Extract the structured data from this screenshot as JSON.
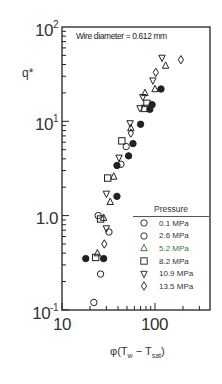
{
  "chart_data": {
    "type": "scatter",
    "title": "",
    "annotation": "Wire diameter = 0.612 mm",
    "xlabel": "φ(Tw − Tsat)",
    "ylabel": "q*",
    "xscale": "log",
    "yscale": "log",
    "xlim": [
      10,
      250
    ],
    "ylim": [
      0.1,
      100
    ],
    "x_ticks": [
      "10",
      "100"
    ],
    "y_ticks": [
      "10^-1",
      "1.0",
      "10^1",
      "10^2"
    ],
    "grid": false,
    "legend_title": "Pressure",
    "legend_position": "lower right",
    "series": [
      {
        "name": "0.1 MPa",
        "marker": "filled-circle",
        "points": [
          [
            116,
            22
          ],
          [
            93,
            15
          ],
          [
            88,
            13.4
          ],
          [
            70,
            9.3
          ],
          [
            58,
            5.8
          ],
          [
            52,
            4.3
          ],
          [
            39,
            3.4
          ],
          [
            39,
            1.6
          ],
          [
            18,
            0.35
          ],
          [
            28,
            0.35
          ]
        ]
      },
      {
        "name": "2.6 MPa",
        "marker": "circle",
        "points": [
          [
            49,
            5.4
          ],
          [
            43,
            3.5
          ],
          [
            24.5,
            1.0
          ],
          [
            32,
            0.67
          ],
          [
            26,
            0.24
          ],
          [
            22,
            0.12
          ]
        ]
      },
      {
        "name": "5.2 MPa",
        "marker": "triangle-up",
        "points": [
          [
            130,
            39
          ],
          [
            100,
            22
          ],
          [
            78,
            20
          ],
          [
            55,
            8.5
          ],
          [
            36,
            2.6
          ],
          [
            33,
            1.4
          ],
          [
            28,
            0.95
          ],
          [
            24,
            0.4
          ]
        ]
      },
      {
        "name": "8.2 MPa",
        "marker": "square",
        "points": [
          [
            82,
            15.5
          ],
          [
            78,
            13.7
          ],
          [
            44,
            6.2
          ],
          [
            31,
            2.5
          ],
          [
            26,
            0.92
          ],
          [
            23,
            0.36
          ]
        ]
      },
      {
        "name": "10.9 MPa",
        "marker": "triangle-down",
        "points": [
          [
            119,
            47
          ],
          [
            95,
            27
          ],
          [
            74,
            18
          ],
          [
            69,
            13.7
          ],
          [
            54,
            9.5
          ],
          [
            41,
            4.1
          ],
          [
            30,
            1.7
          ],
          [
            30,
            0.73
          ]
        ]
      },
      {
        "name": "13.5 MPa",
        "marker": "diamond",
        "points": [
          [
            190,
            45
          ],
          [
            102,
            33
          ],
          [
            55,
            7.5
          ],
          [
            28.5,
            0.5
          ]
        ]
      }
    ]
  },
  "labels": {
    "annotation": "Wire diameter = 0.612 mm",
    "ylabel": "q*",
    "xlabel_main": "φ(T",
    "xlabel_sub1": "w",
    "xlabel_mid": " − T",
    "xlabel_sub2": "sat",
    "xlabel_end": ")",
    "ytick_100_base": "10",
    "ytick_100_exp": "2",
    "ytick_10_base": "10",
    "ytick_10_exp": "1",
    "ytick_1": "1.0",
    "ytick_01_base": "10",
    "ytick_01_exp": "-1",
    "xtick_10": "10",
    "xtick_100": "100"
  },
  "legend": {
    "title": "Pressure",
    "items": [
      {
        "label": "0.1 MPa",
        "marker": "circle",
        "color": "#333333"
      },
      {
        "label": "2.6 MPa",
        "marker": "circle",
        "color": "#333333"
      },
      {
        "label": "5.2 MPa",
        "marker": "triangle-up",
        "color": "#3a7a3a"
      },
      {
        "label": "8.2 MPa",
        "marker": "square",
        "color": "#333333"
      },
      {
        "label": "10.9 MPa",
        "marker": "triangle-down",
        "color": "#333333"
      },
      {
        "label": "13.5 MPa",
        "marker": "diamond",
        "color": "#333333"
      }
    ]
  },
  "colors": {
    "axis": "#222222",
    "marker": "#222222",
    "accent_green": "#3a7a3a"
  }
}
